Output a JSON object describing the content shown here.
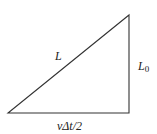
{
  "diagram": {
    "type": "right-triangle",
    "labels": {
      "hypotenuse": "L",
      "vertical_side": "L",
      "vertical_side_subscript": "0",
      "horizontal_side": "vΔt/2"
    },
    "stroke_color": "#333333"
  }
}
